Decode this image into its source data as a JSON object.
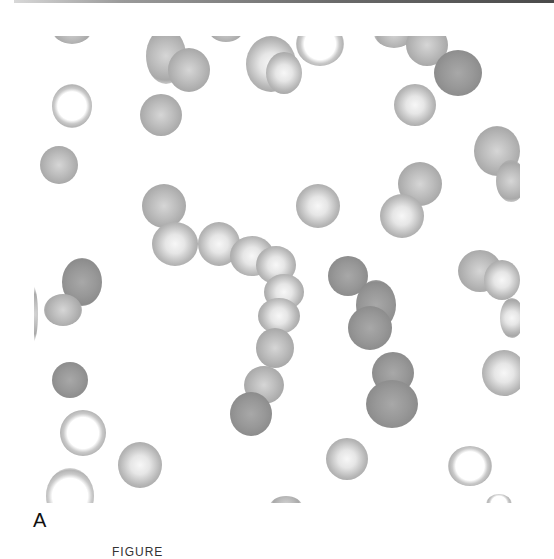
{
  "figure": {
    "panel_label": "A",
    "caption_partial": "FIGURE"
  },
  "colors": {
    "background": "#ffffff",
    "cell_gray": "#a6a6a6",
    "top_rule": "#4a4a4a"
  },
  "cells": [
    {
      "x": 18,
      "y": -22,
      "w": 40,
      "h": 30,
      "tone": "mid"
    },
    {
      "x": 112,
      "y": -8,
      "w": 40,
      "h": 56,
      "tone": "mid"
    },
    {
      "x": 134,
      "y": 12,
      "w": 42,
      "h": 44,
      "tone": "mid"
    },
    {
      "x": 106,
      "y": 58,
      "w": 42,
      "h": 42,
      "tone": "mid"
    },
    {
      "x": 174,
      "y": -22,
      "w": 36,
      "h": 28,
      "tone": "mid"
    },
    {
      "x": 212,
      "y": 0,
      "w": 50,
      "h": 56,
      "tone": "pale"
    },
    {
      "x": 232,
      "y": 16,
      "w": 36,
      "h": 42,
      "tone": "pale"
    },
    {
      "x": 262,
      "y": -14,
      "w": 48,
      "h": 44,
      "tone": "ring"
    },
    {
      "x": 340,
      "y": -18,
      "w": 40,
      "h": 30,
      "tone": "mid"
    },
    {
      "x": 372,
      "y": -12,
      "w": 42,
      "h": 42,
      "tone": "mid"
    },
    {
      "x": 400,
      "y": 14,
      "w": 48,
      "h": 46,
      "tone": "dark"
    },
    {
      "x": 360,
      "y": 48,
      "w": 42,
      "h": 42,
      "tone": "pale"
    },
    {
      "x": 18,
      "y": 48,
      "w": 40,
      "h": 44,
      "tone": "ring"
    },
    {
      "x": 6,
      "y": 110,
      "w": 38,
      "h": 38,
      "tone": "mid"
    },
    {
      "x": 440,
      "y": 90,
      "w": 46,
      "h": 50,
      "tone": "mid"
    },
    {
      "x": 462,
      "y": 124,
      "w": 30,
      "h": 42,
      "tone": "mid"
    },
    {
      "x": 108,
      "y": 148,
      "w": 44,
      "h": 44,
      "tone": "mid"
    },
    {
      "x": 118,
      "y": 186,
      "w": 46,
      "h": 44,
      "tone": "pale"
    },
    {
      "x": 164,
      "y": 186,
      "w": 42,
      "h": 44,
      "tone": "pale"
    },
    {
      "x": 196,
      "y": 200,
      "w": 44,
      "h": 40,
      "tone": "pale"
    },
    {
      "x": 262,
      "y": 148,
      "w": 44,
      "h": 44,
      "tone": "pale"
    },
    {
      "x": 364,
      "y": 126,
      "w": 44,
      "h": 44,
      "tone": "mid"
    },
    {
      "x": 346,
      "y": 158,
      "w": 44,
      "h": 44,
      "tone": "pale"
    },
    {
      "x": 222,
      "y": 210,
      "w": 40,
      "h": 38,
      "tone": "pale"
    },
    {
      "x": 230,
      "y": 238,
      "w": 40,
      "h": 36,
      "tone": "pale"
    },
    {
      "x": 224,
      "y": 262,
      "w": 42,
      "h": 36,
      "tone": "pale"
    },
    {
      "x": 222,
      "y": 292,
      "w": 38,
      "h": 40,
      "tone": "mid"
    },
    {
      "x": 210,
      "y": 330,
      "w": 40,
      "h": 38,
      "tone": "mid"
    },
    {
      "x": 196,
      "y": 356,
      "w": 42,
      "h": 44,
      "tone": "dark"
    },
    {
      "x": 294,
      "y": 220,
      "w": 40,
      "h": 40,
      "tone": "dark"
    },
    {
      "x": 322,
      "y": 244,
      "w": 40,
      "h": 50,
      "tone": "dark"
    },
    {
      "x": 314,
      "y": 270,
      "w": 44,
      "h": 44,
      "tone": "dark"
    },
    {
      "x": 338,
      "y": 316,
      "w": 42,
      "h": 42,
      "tone": "dark"
    },
    {
      "x": 332,
      "y": 344,
      "w": 52,
      "h": 48,
      "tone": "dark"
    },
    {
      "x": 424,
      "y": 214,
      "w": 44,
      "h": 42,
      "tone": "mid"
    },
    {
      "x": 450,
      "y": 224,
      "w": 36,
      "h": 40,
      "tone": "pale"
    },
    {
      "x": 466,
      "y": 262,
      "w": 24,
      "h": 40,
      "tone": "pale"
    },
    {
      "x": 448,
      "y": 314,
      "w": 44,
      "h": 46,
      "tone": "pale"
    },
    {
      "x": 28,
      "y": 222,
      "w": 40,
      "h": 48,
      "tone": "dark"
    },
    {
      "x": 10,
      "y": 258,
      "w": 38,
      "h": 32,
      "tone": "mid"
    },
    {
      "x": -6,
      "y": 250,
      "w": 10,
      "h": 56,
      "tone": "mid"
    },
    {
      "x": 18,
      "y": 326,
      "w": 36,
      "h": 36,
      "tone": "dark"
    },
    {
      "x": 26,
      "y": 374,
      "w": 46,
      "h": 46,
      "tone": "ring"
    },
    {
      "x": 84,
      "y": 406,
      "w": 44,
      "h": 46,
      "tone": "pale"
    },
    {
      "x": 12,
      "y": 432,
      "w": 48,
      "h": 56,
      "tone": "ring"
    },
    {
      "x": 292,
      "y": 402,
      "w": 42,
      "h": 42,
      "tone": "pale"
    },
    {
      "x": 414,
      "y": 410,
      "w": 44,
      "h": 40,
      "tone": "ring"
    },
    {
      "x": 236,
      "y": 460,
      "w": 32,
      "h": 20,
      "tone": "mid"
    },
    {
      "x": 452,
      "y": 458,
      "w": 26,
      "h": 20,
      "tone": "ring"
    }
  ]
}
